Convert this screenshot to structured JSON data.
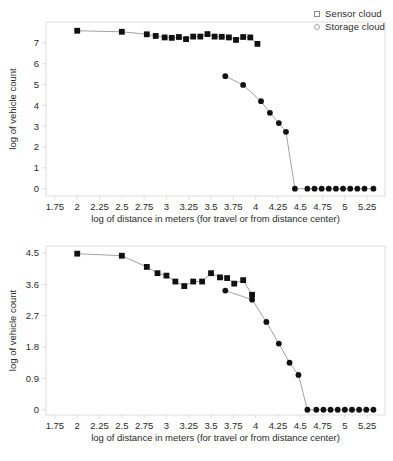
{
  "figure": {
    "background_color": "#ffffff",
    "marker_color": "#111111",
    "line_color": "#8a8a8a",
    "axis_color": "#d9d9d9",
    "text_color": "#2a2a2a"
  },
  "legend": {
    "position": "top-right",
    "entries": [
      {
        "label": "Sensor cloud",
        "marker": "square-icon"
      },
      {
        "label": "Storage cloud",
        "marker": "circle-icon"
      }
    ]
  },
  "chart_data": [
    {
      "id": "top-chart",
      "type": "scatter",
      "title": "",
      "xlabel": "log of distance in meters (for travel or from distance center)",
      "ylabel": "log of vehicle count",
      "xlim": [
        1.65,
        5.45
      ],
      "ylim": [
        -0.35,
        8.0
      ],
      "xticks": [
        1.75,
        2,
        2.25,
        2.5,
        2.75,
        3,
        3.25,
        3.5,
        3.75,
        4,
        4.25,
        4.5,
        4.75,
        5,
        5.25
      ],
      "xtick_labels": [
        "1.75",
        "2",
        "2.25",
        "2.5",
        "2.75",
        "3",
        "3.25",
        "3.5",
        "3.75",
        "4",
        "4.25",
        "4.5",
        "4.75",
        "5",
        "5.25"
      ],
      "yticks": [
        0,
        1,
        2,
        3,
        4,
        5,
        6,
        7
      ],
      "ytick_labels": [
        "0",
        "1",
        "2",
        "3",
        "4",
        "5",
        "6",
        "7"
      ],
      "grid": false,
      "legend_position": "top-right",
      "series": [
        {
          "name": "Sensor cloud",
          "marker": "square",
          "x": [
            2.0,
            2.5,
            2.78,
            2.88,
            2.98,
            3.06,
            3.14,
            3.22,
            3.3,
            3.38,
            3.46,
            3.54,
            3.62,
            3.7,
            3.78,
            3.86,
            3.94,
            4.02
          ],
          "y": [
            7.58,
            7.53,
            7.41,
            7.33,
            7.26,
            7.24,
            7.28,
            7.18,
            7.3,
            7.3,
            7.42,
            7.3,
            7.29,
            7.26,
            7.14,
            7.28,
            7.26,
            6.95
          ]
        },
        {
          "name": "Storage cloud",
          "marker": "circle",
          "x": [
            3.66,
            3.86,
            4.06,
            4.16,
            4.26,
            4.34,
            4.44,
            4.58,
            4.66,
            4.74,
            4.82,
            4.9,
            4.98,
            5.06,
            5.14,
            5.22,
            5.32
          ],
          "y": [
            5.4,
            4.98,
            4.2,
            3.64,
            3.15,
            2.73,
            0.0,
            0.0,
            0.0,
            0.0,
            0.0,
            0.0,
            0.0,
            0.0,
            0.0,
            0.0,
            0.0
          ]
        }
      ]
    },
    {
      "id": "bottom-chart",
      "type": "scatter",
      "title": "",
      "xlabel": "log of distance in meters (for travel or from distance center)",
      "ylabel": "log of vehicle count",
      "xlim": [
        1.65,
        5.45
      ],
      "ylim": [
        -0.15,
        4.7
      ],
      "xticks": [
        1.75,
        2,
        2.25,
        2.5,
        2.75,
        3,
        3.25,
        3.5,
        3.75,
        4,
        4.25,
        4.5,
        4.75,
        5,
        5.25
      ],
      "xtick_labels": [
        "1.75",
        "2",
        "2.25",
        "2.5",
        "2.75",
        "3",
        "3.25",
        "3.5",
        "3.75",
        "4",
        "4.25",
        "4.5",
        "4.75",
        "5",
        "5.25"
      ],
      "yticks": [
        0,
        0.9,
        1.8,
        2.7,
        3.6,
        4.5
      ],
      "ytick_labels": [
        "0",
        "0.9",
        "1.8",
        "2.7",
        "3.6",
        "4.5"
      ],
      "grid": false,
      "legend_position": "none",
      "series": [
        {
          "name": "Sensor cloud",
          "marker": "square",
          "x": [
            2.0,
            2.5,
            2.78,
            2.9,
            3.0,
            3.1,
            3.2,
            3.3,
            3.4,
            3.5,
            3.6,
            3.68,
            3.76,
            3.86,
            3.96
          ],
          "y": [
            4.48,
            4.42,
            4.1,
            3.92,
            3.85,
            3.68,
            3.55,
            3.68,
            3.68,
            3.92,
            3.8,
            3.78,
            3.62,
            3.72,
            3.3
          ]
        },
        {
          "name": "Storage cloud",
          "marker": "circle",
          "x": [
            3.66,
            3.96,
            4.12,
            4.26,
            4.38,
            4.48,
            4.58,
            4.68,
            4.76,
            4.84,
            4.92,
            5.0,
            5.08,
            5.16,
            5.24,
            5.32
          ],
          "y": [
            3.42,
            3.16,
            2.52,
            1.9,
            1.35,
            1.0,
            0.0,
            0.0,
            0.0,
            0.0,
            0.0,
            0.0,
            0.0,
            0.0,
            0.0,
            0.0
          ]
        }
      ]
    }
  ]
}
